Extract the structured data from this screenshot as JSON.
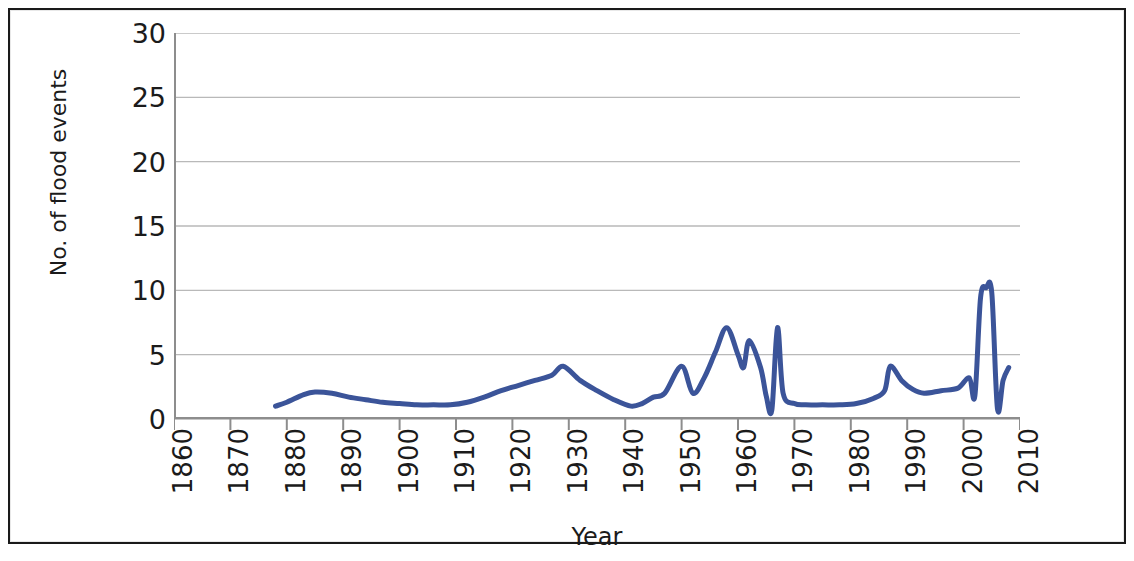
{
  "chart_data": {
    "type": "line",
    "title": "",
    "xlabel": "Year",
    "ylabel": "No. of flood events",
    "xlim": [
      1860,
      2010
    ],
    "ylim": [
      0,
      30
    ],
    "xticks": [
      "1860",
      "1870",
      "1880",
      "1890",
      "1900",
      "1910",
      "1920",
      "1930",
      "1940",
      "1950",
      "1960",
      "1970",
      "1980",
      "1990",
      "2000",
      "2010"
    ],
    "yticks": [
      "0",
      "5",
      "10",
      "15",
      "20",
      "25",
      "30"
    ],
    "grid": "horizontal",
    "legend": "none",
    "series": [
      {
        "name": "No. of flood events",
        "color": "#3b5499",
        "line_width": 5,
        "smoothed": true,
        "x": [
          1878,
          1880,
          1883,
          1885,
          1888,
          1891,
          1894,
          1897,
          1900,
          1903,
          1906,
          1909,
          1912,
          1915,
          1918,
          1921,
          1924,
          1927,
          1929,
          1932,
          1935,
          1938,
          1941,
          1943,
          1945,
          1947,
          1950,
          1952,
          1954,
          1956,
          1958,
          1960,
          1961,
          1962,
          1964,
          1965,
          1966,
          1967,
          1968,
          1970,
          1972,
          1975,
          1978,
          1981,
          1984,
          1986,
          1987,
          1989,
          1991,
          1993,
          1996,
          1999,
          2001,
          2002,
          2003,
          2004,
          2005,
          2006,
          2007,
          2008
        ],
        "y": [
          1.0,
          1.3,
          1.9,
          2.1,
          2.0,
          1.7,
          1.5,
          1.3,
          1.2,
          1.1,
          1.1,
          1.1,
          1.3,
          1.7,
          2.2,
          2.6,
          3.0,
          3.4,
          4.1,
          3.0,
          2.2,
          1.5,
          1.0,
          1.2,
          1.7,
          2.0,
          4.1,
          2.0,
          3.2,
          5.2,
          7.1,
          5.0,
          4.0,
          6.1,
          4.0,
          1.8,
          0.7,
          7.1,
          2.0,
          1.2,
          1.1,
          1.1,
          1.1,
          1.2,
          1.6,
          2.2,
          4.1,
          3.0,
          2.3,
          2.0,
          2.2,
          2.4,
          3.2,
          1.8,
          9.4,
          10.2,
          9.8,
          0.8,
          3.0,
          4.0
        ]
      }
    ]
  },
  "axis": {
    "y_title": "No. of flood events",
    "x_title": "Year"
  }
}
